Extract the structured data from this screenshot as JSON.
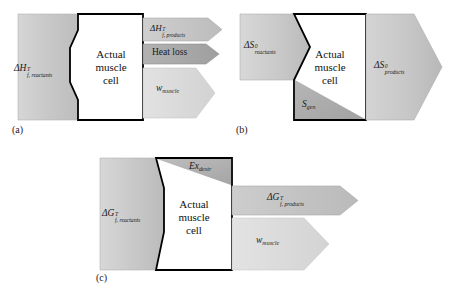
{
  "figure": {
    "background_color": "#ffffff",
    "cell_label_lines": [
      "Actual",
      "muscle",
      "cell"
    ],
    "colors": {
      "block_gray_light": "#cfcfcf",
      "block_gray_mid": "#c2c2c2",
      "block_gray_dark": "#a9a9a9",
      "arrow_gray": "#c6c6c6",
      "arrow_gray_dark": "#a8a8a8",
      "arrow_gray_pale": "#dcdcdc",
      "cell_fill": "#ffffff",
      "outline": "#000000",
      "text": "#1a1a1a"
    }
  },
  "panels": [
    {
      "tag": "(a)",
      "name": "enthalpy-balance",
      "cell_label_lines": [
        "Actual",
        "muscle",
        "cell"
      ],
      "inputs": [
        {
          "name": "enthalpy-reactants",
          "symbol": "ΔH",
          "superscript": "T",
          "subscript": "f, reactants",
          "shade": "block_gray_mid"
        }
      ],
      "outputs": [
        {
          "name": "enthalpy-products",
          "symbol": "ΔH",
          "superscript": "T",
          "subscript": "f, products",
          "shade": "arrow_gray"
        },
        {
          "name": "heat-loss",
          "symbol": "Heat loss",
          "superscript": "",
          "subscript": "",
          "shade": "arrow_gray_dark"
        },
        {
          "name": "work-muscle",
          "symbol": "w",
          "superscript": "",
          "subscript": "muscle",
          "shade": "arrow_gray_pale"
        }
      ]
    },
    {
      "tag": "(b)",
      "name": "entropy-balance",
      "cell_label_lines": [
        "Actual",
        "muscle",
        "cell"
      ],
      "inputs": [
        {
          "name": "entropy-reactants",
          "symbol": "ΔS",
          "superscript": "0",
          "subscript": "reactants",
          "shade": "block_gray_mid"
        }
      ],
      "internal": [
        {
          "name": "entropy-generation",
          "symbol": "S",
          "superscript": "",
          "subscript": "gen",
          "shade": "block_gray_dark"
        }
      ],
      "outputs": [
        {
          "name": "entropy-products",
          "symbol": "ΔS",
          "superscript": "0",
          "subscript": "products",
          "shade": "block_gray_mid"
        }
      ]
    },
    {
      "tag": "(c)",
      "name": "exergy-balance",
      "cell_label_lines": [
        "Actual",
        "muscle",
        "cell"
      ],
      "inputs": [
        {
          "name": "gibbs-reactants",
          "symbol": "ΔG",
          "superscript": "T",
          "subscript": "f, reactants",
          "shade": "block_gray_mid"
        }
      ],
      "internal": [
        {
          "name": "exergy-destruction",
          "symbol": "Ex",
          "superscript": "",
          "subscript": "destr",
          "shade": "block_gray_dark"
        }
      ],
      "outputs": [
        {
          "name": "gibbs-products",
          "symbol": "ΔG",
          "superscript": "T",
          "subscript": "f, products",
          "shade": "arrow_gray"
        },
        {
          "name": "work-muscle",
          "symbol": "w",
          "superscript": "",
          "subscript": "muscle",
          "shade": "arrow_gray_pale"
        }
      ]
    }
  ]
}
